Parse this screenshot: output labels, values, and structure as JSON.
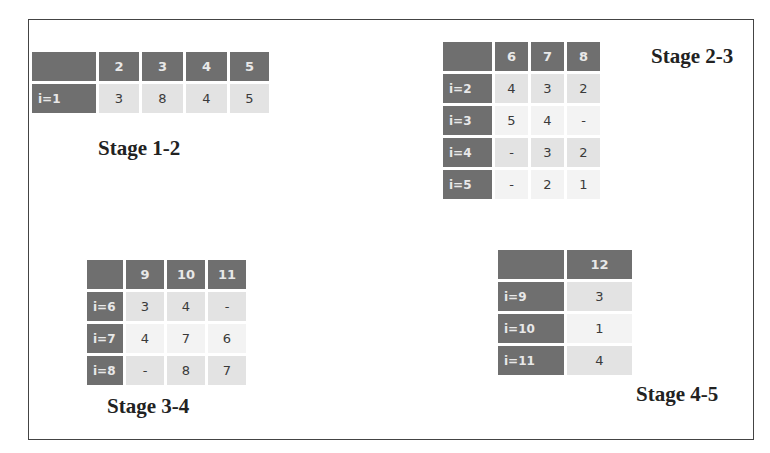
{
  "tables": [
    {
      "label": "Stage 1-2",
      "columns": [
        "",
        "2",
        "3",
        "4",
        "5"
      ],
      "rows": [
        {
          "head": "i=1",
          "cells": [
            "3",
            "8",
            "4",
            "5"
          ]
        }
      ]
    },
    {
      "label": "Stage 2-3",
      "columns": [
        "",
        "6",
        "7",
        "8"
      ],
      "rows": [
        {
          "head": "i=2",
          "cells": [
            "4",
            "3",
            "2"
          ]
        },
        {
          "head": "i=3",
          "cells": [
            "5",
            "4",
            "-"
          ]
        },
        {
          "head": "i=4",
          "cells": [
            "-",
            "3",
            "2"
          ]
        },
        {
          "head": "i=5",
          "cells": [
            "-",
            "2",
            "1"
          ]
        }
      ]
    },
    {
      "label": "Stage 3-4",
      "columns": [
        "",
        "9",
        "10",
        "11"
      ],
      "rows": [
        {
          "head": "i=6",
          "cells": [
            "3",
            "4",
            "-"
          ]
        },
        {
          "head": "i=7",
          "cells": [
            "4",
            "7",
            "6"
          ]
        },
        {
          "head": "i=8",
          "cells": [
            "-",
            "8",
            "7"
          ]
        }
      ]
    },
    {
      "label": "Stage 4-5",
      "columns": [
        "",
        "12"
      ],
      "rows": [
        {
          "head": "i=9",
          "cells": [
            "3"
          ]
        },
        {
          "head": "i=10",
          "cells": [
            "1"
          ]
        },
        {
          "head": "i=11",
          "cells": [
            "4"
          ]
        }
      ]
    }
  ],
  "colors": {
    "header_bg": "#6f6f6f",
    "header_text": "#e8e8e8",
    "cell_odd": "#e3e3e3",
    "cell_even": "#f3f3f3",
    "frame": "#444444"
  }
}
